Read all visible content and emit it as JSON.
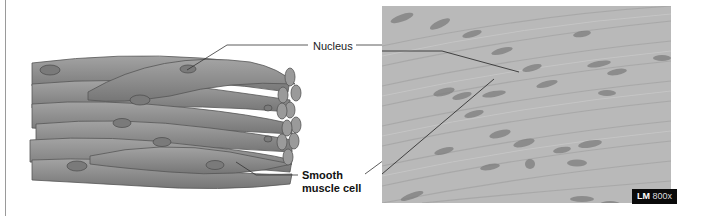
{
  "figure": {
    "labels": {
      "nucleus": "Nucleus",
      "smooth_muscle_line1": "Smooth",
      "smooth_muscle_line2": "muscle cell"
    },
    "micrograph": {
      "technique": "LM",
      "magnification": "800x"
    },
    "colors": {
      "cell_fill": "#8e8e8e",
      "cell_stroke": "#5a5a5a",
      "nucleus_fill": "#6e6e6e",
      "micrograph_bg": "#b9b9b9",
      "leader_line": "#333333"
    }
  }
}
